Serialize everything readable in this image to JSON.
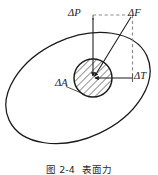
{
  "figure": {
    "caption_number": "图 2-4",
    "caption_title": "表面力",
    "caption_full": "图 2-4  表面力"
  },
  "labels": {
    "delta_p": "ΔP",
    "delta_f": "ΔF",
    "delta_t": "ΔT",
    "delta_a": "ΔA"
  },
  "colors": {
    "stroke": "#1a1a1a",
    "dashed": "#8c8c8c",
    "hatch": "#2b2b2b",
    "background": "#ffffff"
  },
  "diagram_data": {
    "type": "vector-diagram",
    "description": "Body cross-section ellipse with a small hatched area element ΔA; internal force ΔF resolved into normal component ΔP and tangential component ΔT at the element.",
    "body": {
      "shape": "ellipse",
      "center_x": 78,
      "center_y": 88,
      "radius_x": 76,
      "radius_y": 50,
      "rotation_deg": -25
    },
    "area_element": {
      "shape": "circle",
      "label": "ΔA",
      "center_x": 93,
      "center_y": 78,
      "radius": 19,
      "fill": "diagonal-hatch"
    },
    "vectors": [
      {
        "name": "ΔP",
        "kind": "normal-component",
        "from_x": 93,
        "from_y": 18,
        "to_x": 93,
        "to_y": 78,
        "style": "solid",
        "arrow": "end"
      },
      {
        "name": "ΔF",
        "kind": "resultant-force",
        "from_x": 132,
        "from_y": 18,
        "to_x": 93,
        "to_y": 78,
        "style": "solid",
        "arrow": "end"
      },
      {
        "name": "ΔT",
        "kind": "tangential-component",
        "from_x": 132,
        "from_y": 78,
        "to_x": 93,
        "to_y": 78,
        "style": "solid",
        "arrow": "end"
      }
    ],
    "construction_lines": [
      {
        "name": "top-dashed",
        "from_x": 93,
        "from_y": 15,
        "to_x": 132,
        "to_y": 15,
        "style": "dashed"
      },
      {
        "name": "right-dashed",
        "from_x": 132,
        "from_y": 15,
        "to_x": 132,
        "to_y": 78,
        "style": "dashed"
      }
    ],
    "leader_lines": [
      {
        "name": "delta-a-leader",
        "from_x": 66,
        "from_y": 87,
        "to_x": 82,
        "to_y": 94
      }
    ]
  }
}
